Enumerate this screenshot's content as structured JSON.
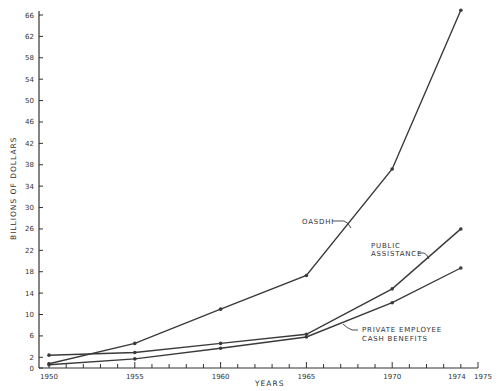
{
  "chart_data": {
    "type": "line",
    "title": "",
    "xlabel": "YEARS",
    "ylabel": "BILLIONS OF DOLLARS",
    "x": [
      1950,
      1955,
      1960,
      1965,
      1970,
      1974
    ],
    "xlim": [
      1950,
      1975
    ],
    "ylim": [
      0,
      66
    ],
    "x_ticks": [
      "1950",
      "1955",
      "1960",
      "1965",
      "1970",
      "1974",
      "1975"
    ],
    "y_ticks": [
      0,
      2,
      6,
      10,
      14,
      18,
      22,
      26,
      30,
      34,
      38,
      42,
      46,
      50,
      54,
      58,
      62,
      66
    ],
    "grid": false,
    "legend": "inline annotations",
    "series": [
      {
        "name": "OASDHI",
        "values": [
          0.8,
          4.6,
          11.0,
          17.3,
          37.2,
          66.9
        ]
      },
      {
        "name": "PUBLIC ASSISTANCE",
        "values": [
          2.4,
          2.9,
          4.6,
          6.3,
          14.8,
          26.0
        ]
      },
      {
        "name": "PRIVATE EMPLOYEE CASH BENEFITS",
        "values": [
          0.6,
          1.7,
          3.7,
          5.8,
          12.2,
          18.7
        ]
      }
    ],
    "annotations": [
      {
        "text": "OASDHI",
        "series": 0
      },
      {
        "text": "PUBLIC ASSISTANCE",
        "lines": [
          "PUBLIC",
          "ASSISTANCE"
        ],
        "series": 1
      },
      {
        "text": "PRIVATE EMPLOYEE CASH BENEFITS",
        "lines": [
          "PRIVATE EMPLOYEE",
          "CASH BENEFITS"
        ],
        "series": 2
      }
    ]
  },
  "colors": {
    "line": "#3a3a3a",
    "axis": "#333333",
    "background": "#ffffff"
  }
}
